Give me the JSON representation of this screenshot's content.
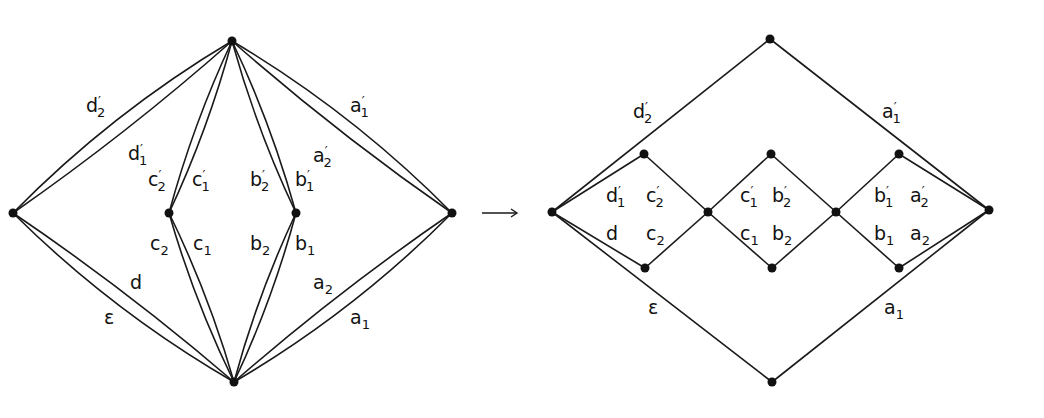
{
  "diagram": {
    "colors": {
      "stroke": "#1a1a1a",
      "node": "#111111",
      "background": "#ffffff"
    },
    "arrow": {
      "symbol": "⟶",
      "from": "left-graph",
      "to": "right-graph"
    },
    "left_graph": {
      "nodes": [
        {
          "id": "top",
          "x": 232,
          "y": 41
        },
        {
          "id": "left",
          "x": 13,
          "y": 213
        },
        {
          "id": "inner-left",
          "x": 169,
          "y": 213
        },
        {
          "id": "inner-right",
          "x": 296,
          "y": 213
        },
        {
          "id": "right",
          "x": 452,
          "y": 213
        },
        {
          "id": "bottom",
          "x": 234,
          "y": 382
        }
      ],
      "edges": [
        {
          "from": "left",
          "to": "top",
          "bend": -18,
          "label": {
            "base": "d",
            "prime": "′",
            "sub": "2",
            "x": 86,
            "y": 112
          }
        },
        {
          "from": "left",
          "to": "top",
          "bend": 8,
          "label": {
            "base": "d",
            "prime": "′",
            "sub": "1",
            "x": 128,
            "y": 160
          }
        },
        {
          "from": "inner-left",
          "to": "top",
          "bend": -8,
          "label": {
            "base": "c",
            "prime": "′",
            "sub": "2",
            "x": 148,
            "y": 186
          }
        },
        {
          "from": "inner-left",
          "to": "top",
          "bend": 8,
          "label": {
            "base": "c",
            "prime": "′",
            "sub": "1",
            "x": 192,
            "y": 186
          }
        },
        {
          "from": "top",
          "to": "inner-right",
          "bend": 8,
          "label": {
            "base": "b",
            "prime": "′",
            "sub": "2",
            "x": 250,
            "y": 186
          }
        },
        {
          "from": "top",
          "to": "inner-right",
          "bend": -8,
          "label": {
            "base": "b",
            "prime": "′",
            "sub": "1",
            "x": 295,
            "y": 186
          }
        },
        {
          "from": "top",
          "to": "right",
          "bend": 8,
          "label": {
            "base": "a",
            "prime": "′",
            "sub": "2",
            "x": 313,
            "y": 162
          }
        },
        {
          "from": "top",
          "to": "right",
          "bend": -18,
          "label": {
            "base": "a",
            "prime": "′",
            "sub": "1",
            "x": 350,
            "y": 112
          }
        },
        {
          "from": "left",
          "to": "bottom",
          "bend": -8,
          "label": {
            "base": "d",
            "prime": "",
            "sub": "",
            "x": 130,
            "y": 289
          }
        },
        {
          "from": "left",
          "to": "bottom",
          "bend": 18,
          "label": {
            "base": "ε",
            "prime": "",
            "sub": "",
            "x": 104,
            "y": 324
          }
        },
        {
          "from": "inner-left",
          "to": "bottom",
          "bend": 8,
          "label": {
            "base": "c",
            "prime": "",
            "sub": "2",
            "x": 150,
            "y": 250
          }
        },
        {
          "from": "inner-left",
          "to": "bottom",
          "bend": -8,
          "label": {
            "base": "c",
            "prime": "",
            "sub": "1",
            "x": 193,
            "y": 250
          }
        },
        {
          "from": "bottom",
          "to": "inner-right",
          "bend": -8,
          "label": {
            "base": "b",
            "prime": "",
            "sub": "2",
            "x": 250,
            "y": 250
          }
        },
        {
          "from": "bottom",
          "to": "inner-right",
          "bend": 8,
          "label": {
            "base": "b",
            "prime": "",
            "sub": "1",
            "x": 295,
            "y": 250
          }
        },
        {
          "from": "bottom",
          "to": "right",
          "bend": -8,
          "label": {
            "base": "a",
            "prime": "",
            "sub": "2",
            "x": 313,
            "y": 289
          }
        },
        {
          "from": "bottom",
          "to": "right",
          "bend": 18,
          "label": {
            "base": "a",
            "prime": "",
            "sub": "1",
            "x": 350,
            "y": 324
          }
        }
      ]
    },
    "right_graph": {
      "nodes": [
        {
          "id": "top",
          "x": 770,
          "y": 39
        },
        {
          "id": "left",
          "x": 552,
          "y": 212
        },
        {
          "id": "d1-top",
          "x": 644,
          "y": 154
        },
        {
          "id": "d1-bottom",
          "x": 645,
          "y": 268
        },
        {
          "id": "mid1",
          "x": 708,
          "y": 212
        },
        {
          "id": "d2-top",
          "x": 771,
          "y": 154
        },
        {
          "id": "d2-bottom",
          "x": 772,
          "y": 268
        },
        {
          "id": "mid2",
          "x": 836,
          "y": 212
        },
        {
          "id": "d3-top",
          "x": 899,
          "y": 154
        },
        {
          "id": "d3-bottom",
          "x": 899,
          "y": 268
        },
        {
          "id": "right",
          "x": 989,
          "y": 210
        },
        {
          "id": "bottom",
          "x": 772,
          "y": 382
        }
      ],
      "edges": [
        {
          "from": "left",
          "to": "top"
        },
        {
          "from": "top",
          "to": "right"
        },
        {
          "from": "left",
          "to": "bottom"
        },
        {
          "from": "bottom",
          "to": "right"
        },
        {
          "from": "left",
          "to": "d1-top"
        },
        {
          "from": "left",
          "to": "d1-bottom"
        },
        {
          "from": "d1-top",
          "to": "mid1"
        },
        {
          "from": "d1-bottom",
          "to": "mid1"
        },
        {
          "from": "mid1",
          "to": "d2-top"
        },
        {
          "from": "mid1",
          "to": "d2-bottom"
        },
        {
          "from": "d2-top",
          "to": "mid2"
        },
        {
          "from": "d2-bottom",
          "to": "mid2"
        },
        {
          "from": "mid2",
          "to": "d3-top"
        },
        {
          "from": "mid2",
          "to": "d3-bottom"
        },
        {
          "from": "d3-top",
          "to": "right"
        },
        {
          "from": "d3-bottom",
          "to": "right"
        }
      ],
      "labels": [
        {
          "base": "d",
          "prime": "′",
          "sub": "2",
          "x": 633,
          "y": 118
        },
        {
          "base": "a",
          "prime": "′",
          "sub": "1",
          "x": 882,
          "y": 118
        },
        {
          "base": "d",
          "prime": "′",
          "sub": "1",
          "x": 606,
          "y": 202
        },
        {
          "base": "c",
          "prime": "′",
          "sub": "2",
          "x": 646,
          "y": 202
        },
        {
          "base": "d",
          "prime": "",
          "sub": "",
          "x": 606,
          "y": 240
        },
        {
          "base": "c",
          "prime": "",
          "sub": "2",
          "x": 646,
          "y": 240
        },
        {
          "base": "c",
          "prime": "′",
          "sub": "1",
          "x": 740,
          "y": 202
        },
        {
          "base": "b",
          "prime": "′",
          "sub": "2",
          "x": 772,
          "y": 202
        },
        {
          "base": "c",
          "prime": "",
          "sub": "1",
          "x": 740,
          "y": 240
        },
        {
          "base": "b",
          "prime": "",
          "sub": "2",
          "x": 772,
          "y": 240
        },
        {
          "base": "b",
          "prime": "′",
          "sub": "1",
          "x": 874,
          "y": 202
        },
        {
          "base": "a",
          "prime": "′",
          "sub": "2",
          "x": 910,
          "y": 202
        },
        {
          "base": "b",
          "prime": "",
          "sub": "1",
          "x": 874,
          "y": 240
        },
        {
          "base": "a",
          "prime": "",
          "sub": "2",
          "x": 910,
          "y": 240
        },
        {
          "base": "ε",
          "prime": "",
          "sub": "",
          "x": 648,
          "y": 314
        },
        {
          "base": "a",
          "prime": "",
          "sub": "1",
          "x": 884,
          "y": 314
        }
      ]
    }
  }
}
